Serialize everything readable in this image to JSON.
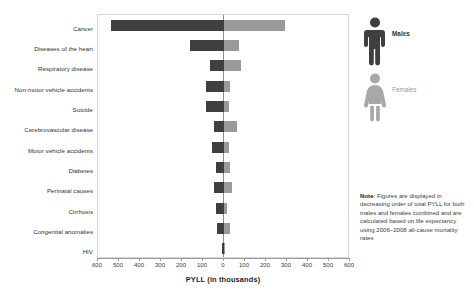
{
  "chart_data": {
    "type": "bar",
    "orientation": "horizontal-diverging",
    "title": "",
    "xlabel": "PYLL (in thousands)",
    "ylabel": "",
    "xlim": [
      -600,
      600
    ],
    "xticks": [
      600,
      500,
      400,
      300,
      200,
      100,
      0,
      100,
      200,
      300,
      400,
      500,
      600
    ],
    "grid": false,
    "legend_position": "right",
    "categories": [
      "Cancer",
      "Diseases of the heart",
      "Respiratory disease",
      "Non-motor vehicle accidents",
      "Suicide",
      "Cerebrovascular disease",
      "Motor vehicle accidents",
      "Diabetes",
      "Perinatal causes",
      "Cirrhosis",
      "Congenital anomalies",
      "HIV"
    ],
    "series": [
      {
        "name": "Males",
        "color": "#3f3f3f",
        "side": "left",
        "values": [
          540,
          160,
          68,
          88,
          86,
          50,
          58,
          38,
          48,
          40,
          32,
          10
        ]
      },
      {
        "name": "Females",
        "color": "#9a9a9a",
        "side": "right",
        "values": [
          290,
          72,
          80,
          30,
          22,
          62,
          26,
          30,
          36,
          12,
          28,
          3
        ]
      }
    ]
  },
  "legend": {
    "items": [
      {
        "label": "Males",
        "icon": "male-figure-icon",
        "color": "#3f3f3f"
      },
      {
        "label": "Females",
        "icon": "female-figure-icon",
        "color": "#9a9a9a"
      }
    ]
  },
  "note": {
    "prefix": "Note",
    "text": ": Figures are displayed in decreasing order of total PYLL for both males and females combined and are calculated based on life expectancy using 2006–2008 all-cause mortality rates"
  },
  "axis": {
    "title": "PYLL (in thousands)"
  }
}
